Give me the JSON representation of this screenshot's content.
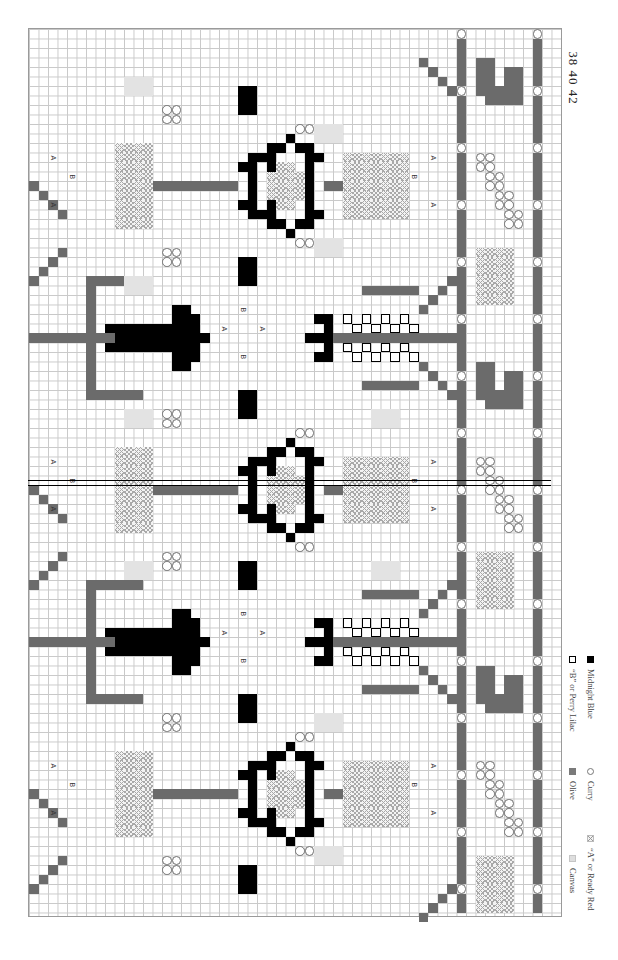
{
  "page": {
    "numbers": "38 40 42",
    "orientation": "rotated-90"
  },
  "chart": {
    "grid": {
      "cell_px": 9.5,
      "cols": 56,
      "rows": 93,
      "major_every": 10
    },
    "colors": {
      "canvas": "#e3e3e3",
      "ready_red_symbol": "#a9a9a9",
      "olive": "#6b6b6b",
      "curry_symbol": "#6d6d6d",
      "perry_lilac_symbol": "#000000",
      "midnight_blue": "#000000"
    },
    "letter_labels": [
      "A",
      "B"
    ],
    "center_marker": "double-line at row 48"
  },
  "legend": {
    "items": [
      {
        "key": "canvas",
        "label": "Canvas"
      },
      {
        "key": "red",
        "label": "“A” or Ready Red"
      },
      {
        "key": "olive",
        "label": "Olive"
      },
      {
        "key": "curry",
        "label": "Curry"
      },
      {
        "key": "lilac",
        "label": "“B” or Perry Lilac"
      },
      {
        "key": "midnight",
        "label": "Midnight Blue"
      }
    ]
  }
}
